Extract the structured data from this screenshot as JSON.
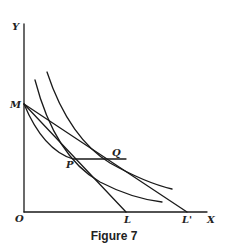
{
  "figure": {
    "caption": "Figure 7",
    "axes": {
      "y_label": "Y",
      "x_label": "X",
      "origin_label": "O"
    },
    "points": {
      "M": "M",
      "P": "P",
      "Q": "Q",
      "L": "L",
      "L_prime": "L'"
    },
    "colors": {
      "line": "#1a1a1a",
      "background": "#ffffff"
    }
  }
}
